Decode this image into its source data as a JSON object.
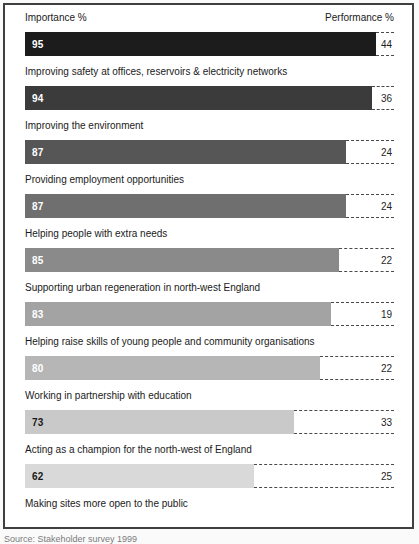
{
  "header": {
    "importance_label": "Importance %",
    "performance_label": "Performance %"
  },
  "caption": "Source: Stakeholder survey 1999",
  "chart_data": {
    "type": "bar",
    "orientation": "horizontal",
    "title": "",
    "xlabel": "",
    "ylabel": "",
    "x_max": 100,
    "grid": false,
    "legend": [
      "Importance %",
      "Performance %"
    ],
    "note": "Solid grey-scale bar = Importance %; dashed outline extends to 100%; number at right = Performance %",
    "rows": [
      {
        "label": "Improving safety at offices, reservoirs & electricity networks",
        "importance": 95,
        "performance": 44,
        "bar_color": "#1c1c1c",
        "value_color": "#ffffff"
      },
      {
        "label": "Improving the environment",
        "importance": 94,
        "performance": 36,
        "bar_color": "#3b3b3b",
        "value_color": "#ffffff"
      },
      {
        "label": "Providing employment opportunities",
        "importance": 87,
        "performance": 24,
        "bar_color": "#565656",
        "value_color": "#ffffff"
      },
      {
        "label": "Helping people with extra needs",
        "importance": 87,
        "performance": 24,
        "bar_color": "#6f6f6f",
        "value_color": "#ffffff"
      },
      {
        "label": "Supporting urban regeneration in north-west England",
        "importance": 85,
        "performance": 22,
        "bar_color": "#8a8a8a",
        "value_color": "#ffffff"
      },
      {
        "label": "Helping raise skills of young people and community organisations",
        "importance": 83,
        "performance": 19,
        "bar_color": "#a3a3a3",
        "value_color": "#ffffff"
      },
      {
        "label": "Working in partnership with education",
        "importance": 80,
        "performance": 22,
        "bar_color": "#b6b6b6",
        "value_color": "#ffffff"
      },
      {
        "label": "Acting as a champion for the north-west of England",
        "importance": 73,
        "performance": 33,
        "bar_color": "#c9c9c9",
        "value_color": "#1a1a1a"
      },
      {
        "label": "Making sites more open to the public",
        "importance": 62,
        "performance": 25,
        "bar_color": "#d9d9d9",
        "value_color": "#1a1a1a"
      }
    ]
  }
}
